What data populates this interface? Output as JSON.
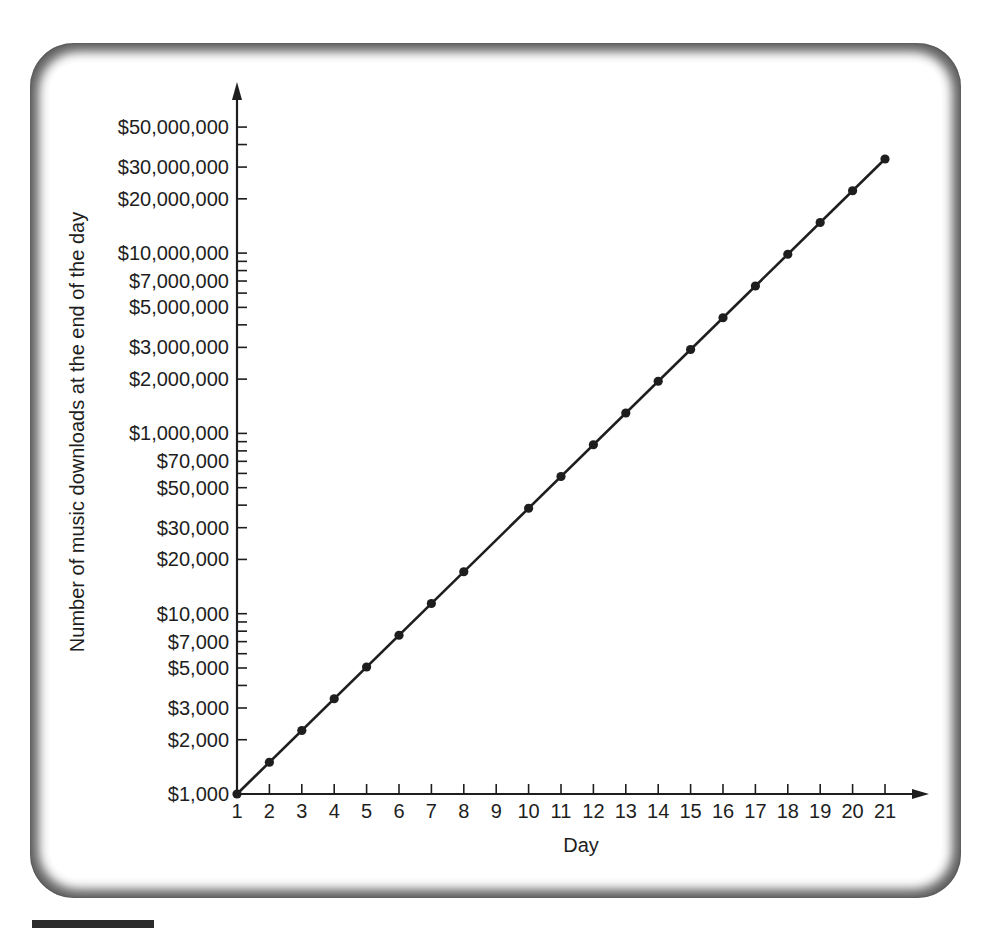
{
  "chart_data": {
    "type": "line",
    "title": "",
    "xlabel": "Day",
    "ylabel": "Number of music downloads at the end of the day",
    "y_scale": "log",
    "x_ticks": [
      "1",
      "2",
      "3",
      "4",
      "5",
      "6",
      "7",
      "8",
      "9",
      "10",
      "11",
      "12",
      "13",
      "14",
      "15",
      "16",
      "17",
      "18",
      "19",
      "20",
      "21"
    ],
    "y_tick_labels": [
      "$1,000",
      "$2,000",
      "$3,000",
      "$5,000",
      "$7,000",
      "$10,000",
      "$20,000",
      "$30,000",
      "$50,000",
      "$70,000",
      "$1,000,000",
      "$2,000,000",
      "$3,000,000",
      "$5,000,000",
      "$7,000,000",
      "$10,000,000",
      "$20,000,000",
      "$30,000,000",
      "$50,000,000"
    ],
    "grid": false,
    "legend": "none",
    "series": [
      {
        "name": "Downloads",
        "x": [
          1,
          2,
          3,
          4,
          5,
          6,
          7,
          8,
          10,
          11,
          12,
          13,
          14,
          15,
          16,
          17,
          18,
          19,
          20,
          21
        ],
        "values_growth_ratio": 1.5,
        "values": [
          1000,
          1500,
          2250,
          3375,
          5063,
          7594,
          11391,
          17086,
          38443,
          57665,
          86498,
          129746,
          194620,
          291929,
          437894,
          656841,
          985261,
          1477892,
          2216838,
          3325257
        ]
      }
    ],
    "note": "Marker missing at day 9; line is continuous. Axis label after $70,000 reads $1,000,000 as printed."
  },
  "axes": {
    "x_title": "Day",
    "y_title": "Number of music downloads at the end of the day"
  },
  "colors": {
    "line": "#1e1e1e",
    "frame_dark": "#4a4a4a",
    "background": "#ffffff"
  }
}
